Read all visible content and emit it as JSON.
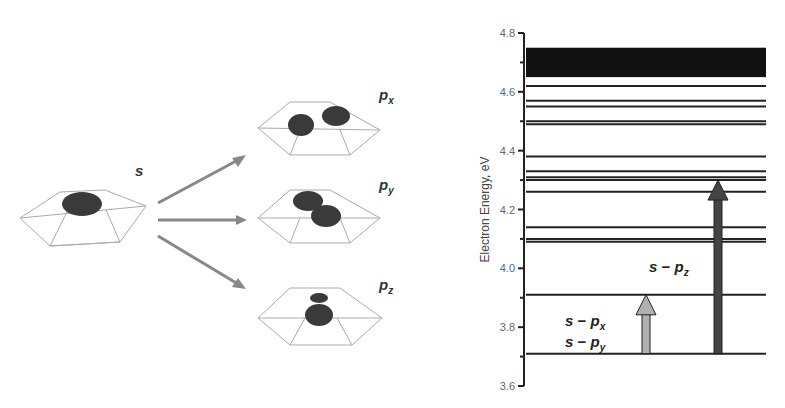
{
  "left_panel": {
    "ground_label": "s",
    "excited_labels": [
      {
        "base": "p",
        "sub": "x"
      },
      {
        "base": "p",
        "sub": "y"
      },
      {
        "base": "p",
        "sub": "z"
      }
    ],
    "arrow_color": "#888888",
    "orbital_color": "#3a3a3a"
  },
  "chart_data": {
    "type": "energy-level diagram",
    "title": "",
    "ylabel": "Electron Energy, eV",
    "ylim": [
      3.6,
      4.8
    ],
    "yticks": [
      "3.6",
      "3.8",
      "4.0",
      "4.2",
      "4.4",
      "4.6",
      "4.8"
    ],
    "band": {
      "from": 4.65,
      "to": 4.75
    },
    "levels": [
      3.71,
      3.91,
      4.09,
      4.1,
      4.14,
      4.26,
      4.3,
      4.31,
      4.33,
      4.38,
      4.49,
      4.5,
      4.55,
      4.57,
      4.62
    ],
    "transitions": [
      {
        "label_lines": [
          {
            "s": "s",
            "p": "p",
            "sub": "x"
          },
          {
            "s": "s",
            "p": "p",
            "sub": "y"
          }
        ],
        "from": 3.71,
        "to": 3.91,
        "color": "#b0b0b0"
      },
      {
        "label_lines": [
          {
            "s": "s",
            "p": "p",
            "sub": "z"
          }
        ],
        "from": 3.71,
        "to": 4.3,
        "color": "#444444"
      }
    ]
  }
}
